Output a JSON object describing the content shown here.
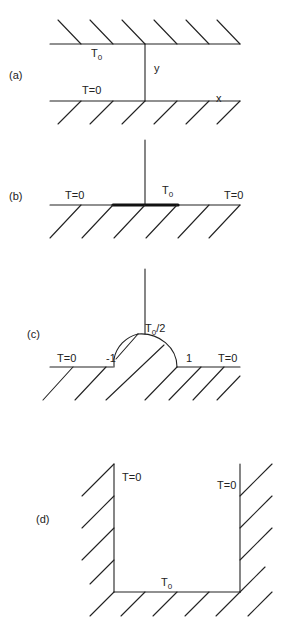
{
  "panels": [
    {
      "id": "a",
      "label": "(a)",
      "top_wall_label": "T",
      "top_wall_sub": "0",
      "bottom_wall_label": "T=0",
      "y_axis_label": "y",
      "x_axis_label": "x"
    },
    {
      "id": "b",
      "label": "(b)",
      "left_label": "T=0",
      "center_label": "T",
      "center_sub": "0",
      "right_label": "T=0"
    },
    {
      "id": "c",
      "label": "(c)",
      "left_label": "T=0",
      "neg_one_label": "-1",
      "arc_label": "T",
      "arc_sub": "0",
      "arc_suffix": "/2",
      "one_label": "1",
      "right_label": "T=0"
    },
    {
      "id": "d",
      "label": "(d)",
      "left_wall_label": "T=0",
      "right_wall_label": "T=0",
      "bottom_label": "T",
      "bottom_sub": "0"
    }
  ],
  "colors": {
    "line": "#222222",
    "background": "#ffffff"
  }
}
